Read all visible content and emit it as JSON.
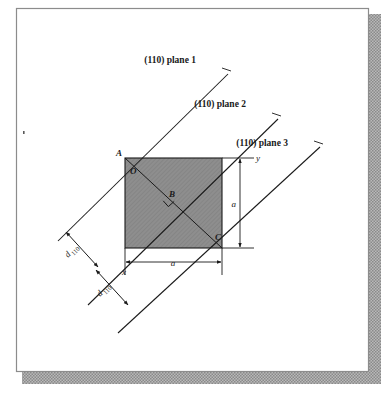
{
  "figure": {
    "title_alt": "(110) planes in a cubic unit cell showing interplanar spacing d110",
    "plane_labels": [
      {
        "text": "(110) plane 1"
      },
      {
        "text": "(110) plane 2"
      },
      {
        "text": "(110) plane 3"
      }
    ],
    "point_labels": [
      {
        "text": "A"
      },
      {
        "text": "O"
      },
      {
        "text": "B"
      },
      {
        "text": "C"
      }
    ],
    "axis_labels": [
      {
        "text": "x"
      },
      {
        "text": "y"
      }
    ],
    "dimension_labels": [
      {
        "text": "a"
      },
      {
        "text": "a"
      }
    ],
    "spacing_labels": [
      {
        "symbol": "d",
        "subscript": "110"
      },
      {
        "symbol": "d",
        "subscript": "110"
      }
    ],
    "colors": {
      "page_background": "#ffffff",
      "frame_border": "#8c8c8c",
      "shadow": "#9a9a9a",
      "line": "#1a1a1a",
      "cell_fill": "#8e8e8e",
      "text": "#1a1a1a"
    }
  }
}
